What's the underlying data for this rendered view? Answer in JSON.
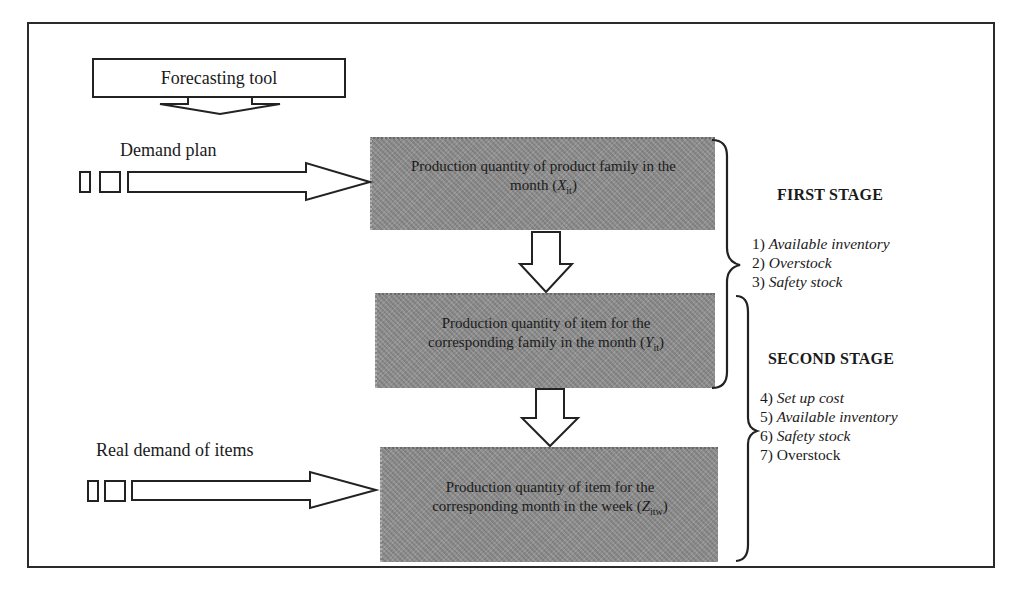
{
  "diagram": {
    "forecasting_tool": "Forecasting tool",
    "inputs": [
      {
        "label": "Demand plan"
      },
      {
        "label": "Real demand of items"
      }
    ],
    "boxes": [
      {
        "text": "Production quantity of product family in the month",
        "var": "X",
        "sub": "it"
      },
      {
        "text": "Production quantity of item for the corresponding family in the month",
        "var": "Y",
        "sub": "it"
      },
      {
        "text": "Production quantity of item for the corresponding month in the week",
        "var": "Z",
        "sub": "itw"
      }
    ],
    "stages": [
      {
        "title": "FIRST STAGE",
        "criteria": [
          {
            "num": "1)",
            "text": "Available inventory",
            "italic": true
          },
          {
            "num": "2)",
            "text": "Overstock",
            "italic": true
          },
          {
            "num": "3)",
            "text": "Safety stock",
            "italic": true
          }
        ]
      },
      {
        "title": "SECOND STAGE",
        "criteria": [
          {
            "num": "4)",
            "text": "Set up cost",
            "italic": true
          },
          {
            "num": "5)",
            "text": "Available inventory",
            "italic": true
          },
          {
            "num": "6)",
            "text": "Safety stock",
            "italic": true
          },
          {
            "num": "7)",
            "text": "Overstock",
            "italic": false
          }
        ]
      }
    ]
  }
}
